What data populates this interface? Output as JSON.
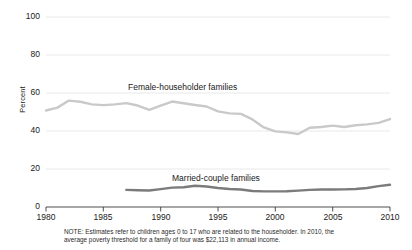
{
  "chart_data": {
    "type": "line",
    "title": "",
    "xlabel": "",
    "ylabel": "Percent",
    "xlim": [
      1980,
      2010
    ],
    "ylim": [
      0,
      100
    ],
    "ytick_labels": [
      "0",
      "20",
      "40",
      "60",
      "80",
      "100"
    ],
    "ytick_values": [
      0,
      20,
      40,
      60,
      80,
      100
    ],
    "xtick_labels": [
      "1980",
      "1985",
      "1990",
      "1995",
      "2000",
      "2005",
      "2010"
    ],
    "xtick_values": [
      1980,
      1985,
      1990,
      1995,
      2000,
      2005,
      2010
    ],
    "grid": "horizontal",
    "legend_position": "inline-annotation",
    "series": [
      {
        "name": "Female-householder families",
        "color": "#c9c9c9",
        "x": [
          1980,
          1981,
          1982,
          1983,
          1984,
          1985,
          1986,
          1987,
          1988,
          1989,
          1990,
          1991,
          1992,
          1993,
          1994,
          1995,
          1996,
          1997,
          1998,
          1999,
          2000,
          2001,
          2002,
          2003,
          2004,
          2005,
          2006,
          2007,
          2008,
          2009,
          2010
        ],
        "values": [
          50.8,
          52.3,
          56.0,
          55.4,
          54.0,
          53.6,
          54.0,
          54.7,
          53.4,
          51.1,
          53.4,
          55.5,
          54.6,
          53.7,
          52.9,
          50.3,
          49.3,
          49.0,
          46.1,
          41.9,
          39.8,
          39.3,
          38.4,
          41.7,
          42.1,
          42.8,
          42.1,
          43.0,
          43.5,
          44.3,
          46.3
        ]
      },
      {
        "name": "Married-couple families",
        "color": "#7b7b7b",
        "x": [
          1987,
          1988,
          1989,
          1990,
          1991,
          1992,
          1993,
          1994,
          1995,
          1996,
          1997,
          1998,
          1999,
          2000,
          2001,
          2002,
          2003,
          2004,
          2005,
          2006,
          2007,
          2008,
          2009,
          2010
        ],
        "values": [
          9.0,
          8.8,
          8.7,
          9.4,
          10.2,
          10.4,
          11.2,
          10.8,
          10.0,
          9.5,
          9.2,
          8.4,
          8.2,
          8.2,
          8.3,
          8.6,
          9.0,
          9.2,
          9.2,
          9.3,
          9.5,
          10.0,
          11.0,
          11.7
        ]
      }
    ],
    "annotations": [
      {
        "text": "Female-householder families",
        "series": "female"
      },
      {
        "text": "Married-couple families",
        "series": "married"
      }
    ],
    "note": {
      "line1": "NOTE: Estimates refer to children ages 0 to 17 who are related to the householder. In 2010, the",
      "line2": "average poverty threshold for a family of four was $22,113 in annual income."
    }
  }
}
